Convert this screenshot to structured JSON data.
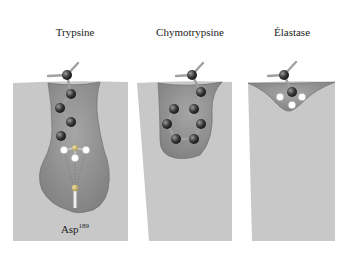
{
  "figure": {
    "panels": [
      {
        "id": "trypsin",
        "title": "Trypsine",
        "pocket": "deep narrow pocket with charged residue at bottom",
        "residue_label": "Asp",
        "residue_number": "189"
      },
      {
        "id": "chymotrypsin",
        "title": "Chymotrypsine",
        "pocket": "wide hydrophobic pocket holding aromatic ring"
      },
      {
        "id": "elastase",
        "title": "Élastase",
        "pocket": "shallow pocket occluded by side chains"
      }
    ],
    "colors": {
      "protein_surface": "#c8c8c8",
      "pocket_fill": "#8f8f8f",
      "atom_dark": "#3a3a3a",
      "atom_white": "#ffffff",
      "bond": "#9a9a9a"
    }
  }
}
